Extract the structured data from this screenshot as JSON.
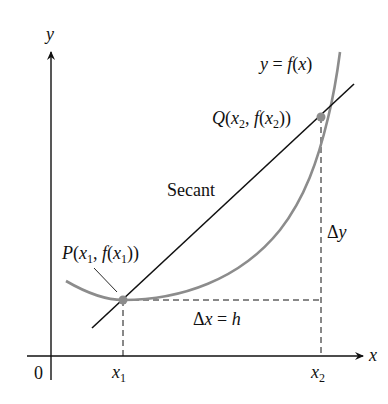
{
  "diagram": {
    "axes": {
      "x_label": "x",
      "y_label": "y",
      "origin_label": "0",
      "x_ticks": [
        "x1",
        "x2"
      ]
    },
    "curve": {
      "label": "y = f(x)",
      "color": "#8c8c8c"
    },
    "secant": {
      "label": "Secant",
      "color": "#111111"
    },
    "points": [
      {
        "name": "P",
        "label": "P(x1, f(x1))",
        "color": "#8c8c8c"
      },
      {
        "name": "Q",
        "label": "Q(x2, f(x2))",
        "color": "#8c8c8c"
      }
    ],
    "increments": {
      "dx_label": "Δx = h",
      "dy_label": "Δy"
    }
  }
}
